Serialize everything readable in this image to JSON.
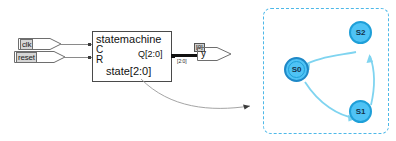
{
  "schematic": {
    "inputs": [
      {
        "name": "clk",
        "label": "clk"
      },
      {
        "name": "reset",
        "label": "reset"
      }
    ],
    "block": {
      "title": "statemachine",
      "pin_clock": "C",
      "pin_reset": "R",
      "output_port": "Q[2:0]",
      "bottom_label": "state[2:0]"
    },
    "bus": {
      "width_tag": "[2:0]",
      "bit_tag": "[0]"
    },
    "output": {
      "label": "y"
    }
  },
  "fsm": {
    "states": [
      {
        "id": "S0",
        "label": "S0",
        "initial": true
      },
      {
        "id": "S1",
        "label": "S1",
        "initial": false
      },
      {
        "id": "S2",
        "label": "S2",
        "initial": false
      }
    ],
    "transitions": [
      {
        "from": "S0",
        "to": "S1"
      },
      {
        "from": "S1",
        "to": "S2"
      },
      {
        "from": "S2",
        "to": "S0"
      }
    ],
    "colors": {
      "node_fill": "#4fc3f5",
      "node_border": "#1e9fd8",
      "accept_ring": "#1e88c7",
      "edge": "#7fd4f0",
      "panel_border": "#4db8e8"
    }
  }
}
